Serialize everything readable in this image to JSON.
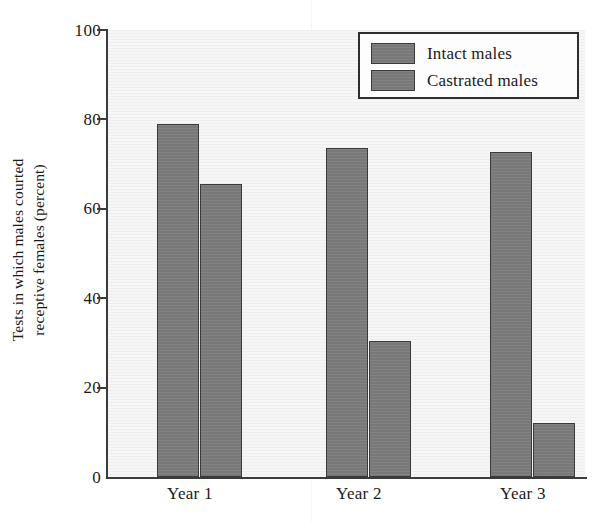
{
  "chart_data": {
    "type": "bar",
    "title": "",
    "xlabel": "",
    "ylabel_line1": "Tests in which males courted",
    "ylabel_line2": "receptive females (percent)",
    "ylabel": "Tests in which males courted receptive females (percent)",
    "categories": [
      "Year 1",
      "Year 2",
      "Year 3"
    ],
    "series": [
      {
        "name": "Intact males",
        "values": [
          79,
          73.6,
          72.7
        ]
      },
      {
        "name": "Castrated males",
        "values": [
          65.5,
          30.5,
          12
        ]
      }
    ],
    "ylim": [
      0,
      100
    ],
    "ytick_values": [
      0,
      20,
      40,
      60,
      80,
      100
    ],
    "ytick_labels": [
      "0",
      "20",
      "40",
      "60",
      "80",
      "100"
    ],
    "grid": false,
    "legend_position": "top-right",
    "bar_fill_color": "#7c7c7c",
    "bar_edge_color": "#3a3a3a",
    "plot_background_color": "#f2f2f2",
    "axis_color": "#3b3b3b"
  },
  "legend": {
    "entries": [
      {
        "label": "Intact males"
      },
      {
        "label": "Castrated males"
      }
    ]
  }
}
